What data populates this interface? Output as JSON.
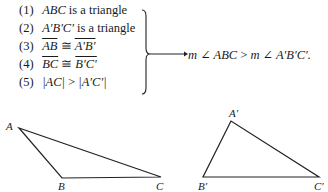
{
  "statements": [
    {
      "num": "(1)",
      "math": "ABC",
      "text": " is a triangle"
    },
    {
      "num": "(2)",
      "math": "A′B′C′",
      "text": " is a triangle"
    },
    {
      "num": "(3)",
      "left": "AB",
      "rel": " ≅ ",
      "right": "A′B′"
    },
    {
      "num": "(4)",
      "left": "BC",
      "rel": " ≅ ",
      "right": "B′C′"
    },
    {
      "num": "(5)",
      "left": "|AC|",
      "rel": " > ",
      "right": "|A′C′|"
    }
  ],
  "conclusion": {
    "left": "m ∠ ABC",
    "rel": " > ",
    "right": "m ∠ A′B′C′."
  },
  "triangles": {
    "first": {
      "A": "A",
      "B": "B",
      "C": "C"
    },
    "second": {
      "A": "A′",
      "B": "B′",
      "C": "C′"
    }
  }
}
